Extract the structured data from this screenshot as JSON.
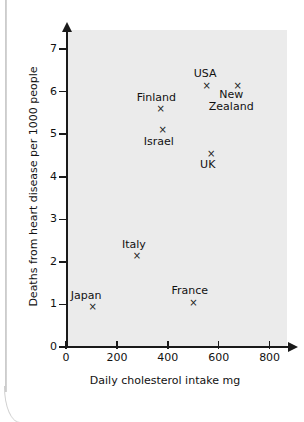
{
  "chart_data": {
    "type": "scatter",
    "title": "",
    "xlabel": "Daily cholesterol intake mg",
    "ylabel": "Deaths from heart disease per 1000 people",
    "xlim": [
      0,
      880
    ],
    "ylim": [
      0,
      7.45
    ],
    "xticks": [
      0,
      200,
      400,
      600,
      800
    ],
    "xtick_labels": [
      "0",
      "200",
      "400",
      "600",
      "800"
    ],
    "yticks": [
      0,
      1,
      2,
      3,
      4,
      5,
      6,
      7
    ],
    "ytick_labels": [
      "0",
      "1",
      "2",
      "3",
      "4",
      "5",
      "6",
      "7"
    ],
    "grid": false,
    "legend": "none",
    "marker": "x",
    "plot_bg_color": "#ebebeb",
    "axis_color": "#1a1a1a",
    "marker_color": "#222222",
    "points": [
      {
        "name": "Japan",
        "label": "Japan",
        "x": 105,
        "y": 0.95,
        "label_dx": -22,
        "label_dy": -17
      },
      {
        "name": "France",
        "label": "France",
        "x": 501,
        "y": 1.05,
        "label_dx": -22,
        "label_dy": -17
      },
      {
        "name": "Italy",
        "label": "Italy",
        "x": 279,
        "y": 2.15,
        "label_dx": -15,
        "label_dy": -17
      },
      {
        "name": "UK",
        "label": "UK",
        "x": 570,
        "y": 4.55,
        "label_dx": -11,
        "label_dy": 6
      },
      {
        "name": "Israel",
        "label": "Israel",
        "x": 380,
        "y": 5.1,
        "label_dx": -19,
        "label_dy": 6
      },
      {
        "name": "Finland",
        "label": "Finland",
        "x": 372,
        "y": 5.6,
        "label_dx": -24,
        "label_dy": -17
      },
      {
        "name": "USA",
        "label": "USA",
        "x": 553,
        "y": 6.15,
        "label_dx": -13,
        "label_dy": -17
      },
      {
        "name": "New Zealand",
        "label": "New\nZealand",
        "x": 675,
        "y": 6.15,
        "label_dx": -29,
        "label_dy": 4
      }
    ]
  }
}
